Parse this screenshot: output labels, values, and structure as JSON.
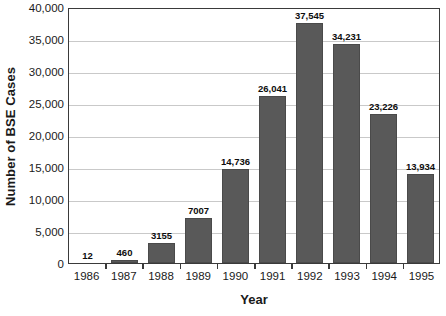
{
  "chart_data": {
    "type": "bar",
    "title": "",
    "xlabel": "Year",
    "ylabel": "Number of BSE Cases",
    "categories": [
      "1986",
      "1987",
      "1988",
      "1989",
      "1990",
      "1991",
      "1992",
      "1993",
      "1994",
      "1995"
    ],
    "values": [
      12,
      460,
      3155,
      7007,
      14736,
      26041,
      37545,
      34231,
      23226,
      13934
    ],
    "value_labels": [
      "12",
      "460",
      "3155",
      "7007",
      "14,736",
      "26,041",
      "37,545",
      "34,231",
      "23,226",
      "13,934"
    ],
    "ylim": [
      0,
      40000
    ],
    "ytick_values": [
      0,
      5000,
      10000,
      15000,
      20000,
      25000,
      30000,
      35000,
      40000
    ],
    "ytick_labels": [
      "0",
      "5,000",
      "10,000",
      "15,000",
      "20,000",
      "25,000",
      "30,000",
      "35,000",
      "40,000"
    ],
    "grid": true,
    "legend": false,
    "series_color": "#595959",
    "gridline_color": "#c9c9c9",
    "axis_color": "#3a3a3a",
    "background_color": "#ffffff"
  }
}
